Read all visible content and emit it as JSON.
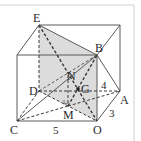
{
  "figure": {
    "type": "3d-geometry-diagram",
    "colors": {
      "stroke": "#5a5a5a",
      "shade": "#d9d9d9",
      "frame": "#cfcfcf",
      "text": "#2a2a2a"
    },
    "vertices": {
      "E": "E",
      "B": "B",
      "D": "D",
      "A": "A",
      "C": "C",
      "O": "O",
      "N": "N",
      "G": "G",
      "M": "M"
    },
    "dimensions": {
      "CO": "5",
      "OA": "3",
      "height": "4"
    }
  }
}
